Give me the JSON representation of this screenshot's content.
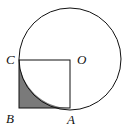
{
  "diagram": {
    "type": "geometry",
    "labels": {
      "C": "C",
      "O": "O",
      "B": "B",
      "A": "A"
    },
    "points": {
      "O": [
        70,
        60
      ],
      "C": [
        18,
        60
      ],
      "B": [
        18,
        108
      ],
      "A": [
        70,
        108
      ]
    },
    "circle": {
      "center": "O",
      "radius": 51
    },
    "shaded_region": "region bounded by segment CB, segment BA, and arc AC",
    "colors": {
      "stroke": "#111111",
      "shade": "#7a7a7a",
      "background": "#ffffff"
    }
  }
}
